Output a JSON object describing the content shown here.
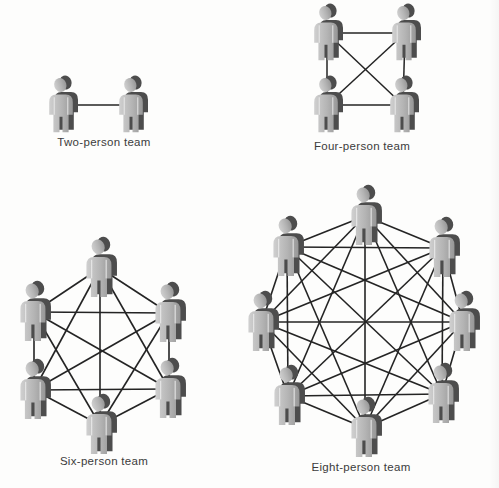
{
  "page": {
    "background": "#fdfdfc"
  },
  "colors": {
    "line": "#242424",
    "label_text": "#3b3b3b",
    "person_front_light": "#d0d0d0",
    "person_front_mid": "#b4b4b4",
    "person_front_dark": "#979797",
    "person_side": "#4d4d4d",
    "person_gap": "#eeeeee"
  },
  "figure": {
    "description_type": "team-communication-paths",
    "diagrams": [
      {
        "id": "two-person",
        "label": "Two-person team",
        "members": 2,
        "communication_links": 1,
        "complete_graph": true,
        "person_scale": 1.0,
        "line_width": 1.5,
        "label_pos": {
          "x": 104,
          "y": 136
        },
        "nodes": [
          {
            "x": 62,
            "y": 105
          },
          {
            "x": 132,
            "y": 105
          }
        ]
      },
      {
        "id": "four-person",
        "label": "Four-person team",
        "members": 4,
        "communication_links": 6,
        "complete_graph": true,
        "person_scale": 1.0,
        "line_width": 1.5,
        "label_pos": {
          "x": 362,
          "y": 140
        },
        "nodes": [
          {
            "x": 327,
            "y": 33
          },
          {
            "x": 405,
            "y": 33
          },
          {
            "x": 327,
            "y": 105
          },
          {
            "x": 403,
            "y": 105
          }
        ]
      },
      {
        "id": "six-person",
        "label": "Six-person team",
        "members": 6,
        "communication_links": 15,
        "complete_graph": true,
        "person_scale": 1.06,
        "line_width": 1.6,
        "label_pos": {
          "x": 104,
          "y": 455
        },
        "nodes": [
          {
            "x": 100,
            "y": 268
          },
          {
            "x": 34,
            "y": 312
          },
          {
            "x": 169,
            "y": 313
          },
          {
            "x": 34,
            "y": 390
          },
          {
            "x": 169,
            "y": 389
          },
          {
            "x": 100,
            "y": 425
          }
        ]
      },
      {
        "id": "eight-person",
        "label": "Eight-person team",
        "members": 8,
        "communication_links": 28,
        "complete_graph": true,
        "person_scale": 1.06,
        "line_width": 1.6,
        "label_pos": {
          "x": 361,
          "y": 461
        },
        "nodes": [
          {
            "x": 365,
            "y": 216
          },
          {
            "x": 287,
            "y": 247
          },
          {
            "x": 443,
            "y": 248
          },
          {
            "x": 262,
            "y": 322
          },
          {
            "x": 463,
            "y": 322
          },
          {
            "x": 288,
            "y": 396
          },
          {
            "x": 442,
            "y": 394
          },
          {
            "x": 365,
            "y": 428
          }
        ]
      }
    ]
  }
}
